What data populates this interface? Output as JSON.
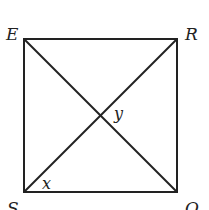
{
  "diagram": {
    "type": "square-with-diagonals",
    "vertices": {
      "top_left": "E",
      "top_right": "R",
      "bottom_left": "S",
      "bottom_right": "O"
    },
    "angle_labels": {
      "at_S": "x",
      "at_center": "y"
    },
    "stroke_color": "#222222",
    "background": "#ffffff"
  }
}
